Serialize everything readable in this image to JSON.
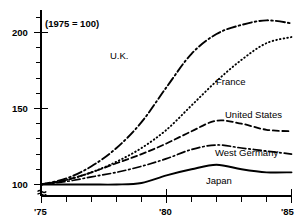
{
  "chart_data": {
    "type": "line",
    "title": "(1975 = 100)",
    "xlabel": "",
    "ylabel": "",
    "xlim": [
      1975,
      1985
    ],
    "ylim": [
      95,
      215
    ],
    "grid": false,
    "legend_position": "inline-labels",
    "y_ticks_major": [
      100,
      150,
      200
    ],
    "y_tick_labels": [
      "100",
      "150",
      "200"
    ],
    "y_ticks_minor": [
      110,
      120,
      130,
      140,
      160,
      170,
      180,
      190,
      210
    ],
    "x_ticks": [
      1975,
      1976,
      1977,
      1978,
      1979,
      1980,
      1981,
      1982,
      1983,
      1984,
      1985
    ],
    "x_tick_labels_major": [
      "'75",
      "'80",
      "'85"
    ],
    "axis_break": true,
    "x": [
      1975,
      1976,
      1977,
      1978,
      1979,
      1980,
      1981,
      1982,
      1983,
      1984,
      1985
    ],
    "series": [
      {
        "name": "U.K.",
        "style": "dash-dot",
        "label_x": 110,
        "label_y": 51,
        "values": [
          100,
          104,
          112,
          124,
          141,
          164,
          186,
          199,
          205,
          208,
          206
        ]
      },
      {
        "name": "France",
        "style": "dotted",
        "label_x": 216,
        "label_y": 77,
        "values": [
          100,
          103,
          108,
          115,
          124,
          136,
          152,
          168,
          182,
          193,
          197
        ]
      },
      {
        "name": "United States",
        "style": "dashed",
        "label_x": 238,
        "label_y": 110,
        "values": [
          100,
          103,
          108,
          114,
          120,
          127,
          135,
          142,
          140,
          136,
          135
        ]
      },
      {
        "name": "West Germany",
        "style": "dash-dot-thin",
        "label_x": 225,
        "label_y": 148,
        "values": [
          100,
          102,
          105,
          108,
          112,
          117,
          123,
          126,
          124,
          122,
          120
        ]
      },
      {
        "name": "Japan",
        "style": "solid",
        "label_x": 206,
        "label_y": 176,
        "values": [
          100,
          100,
          100,
          100,
          101,
          106,
          110,
          113,
          110,
          108,
          108
        ]
      }
    ]
  },
  "axis": {
    "note": "(1975 = 100)",
    "y_labels": [
      "200",
      "150",
      "100"
    ],
    "x_labels": [
      "'75",
      "'80",
      "'85"
    ]
  }
}
